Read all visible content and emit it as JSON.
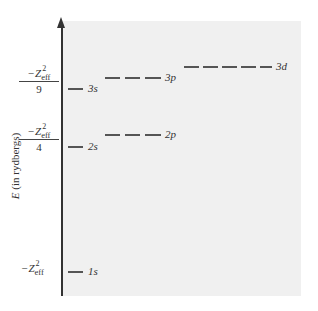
{
  "diagram": {
    "type": "energy-level-diagram",
    "y_axis_label_symbol": "E",
    "y_axis_label_unit": "(in rydbergs)",
    "energy_labels": [
      {
        "id": "n3",
        "numerator": "−Z",
        "superscript": "2",
        "subscript": "eff",
        "denominator": "9"
      },
      {
        "id": "n2",
        "numerator": "−Z",
        "superscript": "2",
        "subscript": "eff",
        "denominator": "4"
      },
      {
        "id": "n1",
        "numerator": "−Z",
        "superscript": "2",
        "subscript": "eff",
        "denominator": ""
      }
    ],
    "levels": [
      {
        "orbital": "1s",
        "n": 1,
        "l": "s",
        "degeneracy": 1
      },
      {
        "orbital": "2s",
        "n": 2,
        "l": "s",
        "degeneracy": 1
      },
      {
        "orbital": "2p",
        "n": 2,
        "l": "p",
        "degeneracy": 3
      },
      {
        "orbital": "3s",
        "n": 3,
        "l": "s",
        "degeneracy": 1
      },
      {
        "orbital": "3p",
        "n": 3,
        "l": "p",
        "degeneracy": 3
      },
      {
        "orbital": "3d",
        "n": 3,
        "l": "d",
        "degeneracy": 5
      }
    ],
    "colors": {
      "background_panel": "#f0f0f0",
      "lines": "#555555",
      "text": "#333333"
    }
  }
}
